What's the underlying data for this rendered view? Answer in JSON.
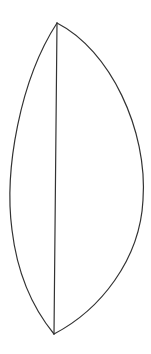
{
  "diagram": {
    "type": "lens-shape",
    "canvas": {
      "width": 151,
      "height": 354,
      "background": "#ffffff"
    },
    "stroke": {
      "color": "#333333",
      "width": 1.2
    },
    "vertices": {
      "top": {
        "x": 57,
        "y": 23
      },
      "bottom": {
        "x": 54,
        "y": 334
      }
    },
    "left_arc": {
      "d": "M57,23 C20,80 4,170 12,230 C18,280 36,312 54,334"
    },
    "right_arc": {
      "d": "M57,23 C110,50 148,130 143,200 C140,260 100,310 54,334"
    },
    "chord": {
      "x1": 57,
      "y1": 23,
      "x2": 54,
      "y2": 334
    }
  }
}
